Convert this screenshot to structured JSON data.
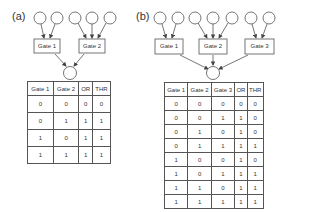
{
  "panels": [
    {
      "label": "(a)",
      "gates": [
        "Gate 1",
        "Gate 2"
      ],
      "inputs_per_gate": [
        2,
        3
      ],
      "table": {
        "headers": [
          "Gate 1",
          "Gate 2",
          "OR",
          "THR"
        ],
        "rows": [
          [
            "0",
            "0",
            "0",
            "0"
          ],
          [
            "0",
            "1",
            "1",
            "1"
          ],
          [
            "1",
            "0",
            "1",
            "1"
          ],
          [
            "1",
            "1",
            "1",
            "1"
          ]
        ]
      }
    },
    {
      "label": "(b)",
      "gates": [
        "Gate 1",
        "Gate 2",
        "Gate 3"
      ],
      "inputs_per_gate": [
        2,
        3,
        2
      ],
      "table": {
        "headers": [
          "Gate 1",
          "Gate 2",
          "Gate 3",
          "OR",
          "THR"
        ],
        "rows": [
          [
            "0",
            "0",
            "0",
            "0",
            "0"
          ],
          [
            "0",
            "0",
            "1",
            "1",
            "0"
          ],
          [
            "0",
            "1",
            "0",
            "1",
            "0"
          ],
          [
            "0",
            "1",
            "1",
            "1",
            "1"
          ],
          [
            "1",
            "0",
            "0",
            "1",
            "0"
          ],
          [
            "1",
            "0",
            "1",
            "1",
            "1"
          ],
          [
            "1",
            "1",
            "0",
            "1",
            "1"
          ],
          [
            "1",
            "1",
            "1",
            "1",
            "1"
          ]
        ]
      }
    }
  ],
  "colors": {
    "stroke": "#555555",
    "text": "#333333"
  }
}
